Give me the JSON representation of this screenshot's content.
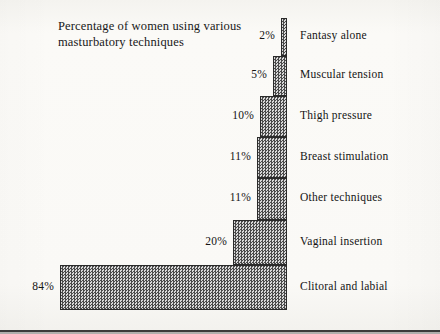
{
  "title": {
    "line1": "Percentage of women using various",
    "line2": "masturbatory techniques"
  },
  "chart_data": {
    "type": "bar",
    "orientation": "horizontal",
    "title": "Percentage of women using various masturbatory techniques",
    "xlabel": "",
    "ylabel": "",
    "grid": false,
    "legend": "none",
    "value_suffix": "%",
    "xlim": [
      0,
      84
    ],
    "categories": [
      "Fantasy alone",
      "Muscular tension",
      "Thigh pressure",
      "Breast stimulation",
      "Other techniques",
      "Vaginal insertion",
      "Clitoral and labial"
    ],
    "values": [
      2,
      5,
      10,
      11,
      11,
      20,
      84
    ],
    "value_labels": [
      "2%",
      "5%",
      "10%",
      "11%",
      "11%",
      "20%",
      "84%"
    ],
    "bars": [
      {
        "category": "Fantasy alone",
        "value": 2,
        "label": "2%",
        "top": 18,
        "height": 38,
        "right": 287
      },
      {
        "category": "Muscular tension",
        "value": 5,
        "label": "5%",
        "top": 56,
        "height": 40,
        "right": 287
      },
      {
        "category": "Thigh pressure",
        "value": 10,
        "label": "10%",
        "top": 96,
        "height": 41,
        "right": 287
      },
      {
        "category": "Breast stimulation",
        "value": 11,
        "label": "11%",
        "top": 137,
        "height": 41,
        "right": 287
      },
      {
        "category": "Other techniques",
        "value": 11,
        "label": "11%",
        "top": 178,
        "height": 42,
        "right": 287
      },
      {
        "category": "Vaginal insertion",
        "value": 20,
        "label": "20%",
        "top": 220,
        "height": 45,
        "right": 287
      },
      {
        "category": "Clitoral and labial",
        "value": 84,
        "label": "84%",
        "top": 265,
        "height": 45,
        "right": 287
      }
    ]
  }
}
